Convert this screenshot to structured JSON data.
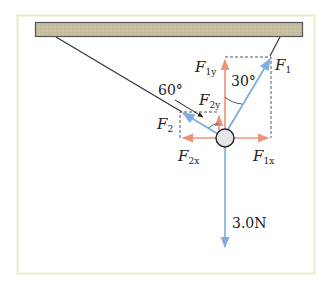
{
  "diagram": {
    "type": "free-body force diagram",
    "frame": {
      "border_color": "#e8ecc8",
      "background": "#ffffff"
    },
    "ceiling": {
      "fill": "#c8bfa0",
      "stroke": "#555555"
    },
    "colors": {
      "resultant_force": "#7eaee0",
      "component_force": "#f0907a",
      "string": "#333333",
      "dashed": "#555555",
      "ball_fill": "#e4e6ea"
    },
    "labels": {
      "F1": {
        "main": "F",
        "sub": "1"
      },
      "F2": {
        "main": "F",
        "sub": "2"
      },
      "F1y": {
        "main": "F",
        "sub": "1y"
      },
      "F2y": {
        "main": "F",
        "sub": "2y"
      },
      "F1x": {
        "main": "F",
        "sub": "1x"
      },
      "F2x": {
        "main": "F",
        "sub": "2x"
      }
    },
    "angles": {
      "angle_F1": "30°",
      "angle_F2": "60°"
    },
    "weight": "3.0N"
  }
}
